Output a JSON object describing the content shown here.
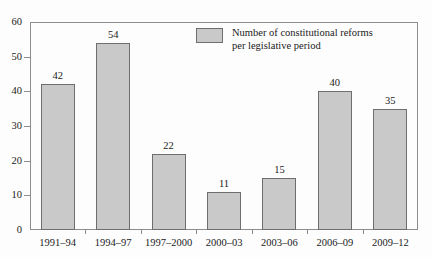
{
  "chart_data": {
    "type": "bar",
    "title": "",
    "subtitle": "",
    "xlabel": "",
    "ylabel": "",
    "categories": [
      "1991–94",
      "1994–97",
      "1997–2000",
      "2000–03",
      "2003–06",
      "2006–09",
      "2009–12"
    ],
    "values": [
      42,
      54,
      22,
      11,
      15,
      40,
      35
    ],
    "series": [
      {
        "name": "Number of constitutional reforms per legislative period",
        "values": [
          42,
          54,
          22,
          11,
          15,
          40,
          35
        ]
      }
    ],
    "ylim": [
      0,
      60
    ],
    "ytick_labels": [
      "0",
      "10",
      "20",
      "30",
      "40",
      "50",
      "60"
    ],
    "ytick_values": [
      0,
      10,
      20,
      30,
      40,
      50,
      60
    ],
    "grid": false,
    "legend_position": "inside-top-center",
    "legend_entries": [
      "Number of constitutional reforms\nper legislative period"
    ],
    "data_labels_shown": true,
    "bar_fill_color": "#c9c9c9",
    "bar_border_color": "#6e6e6e",
    "axis_color": "#8d8d8d",
    "background_color": "#fdfdfd",
    "text_color": "#1a1a1a"
  },
  "legend": {
    "label": "Number of constitutional reforms\nper legislative period"
  }
}
